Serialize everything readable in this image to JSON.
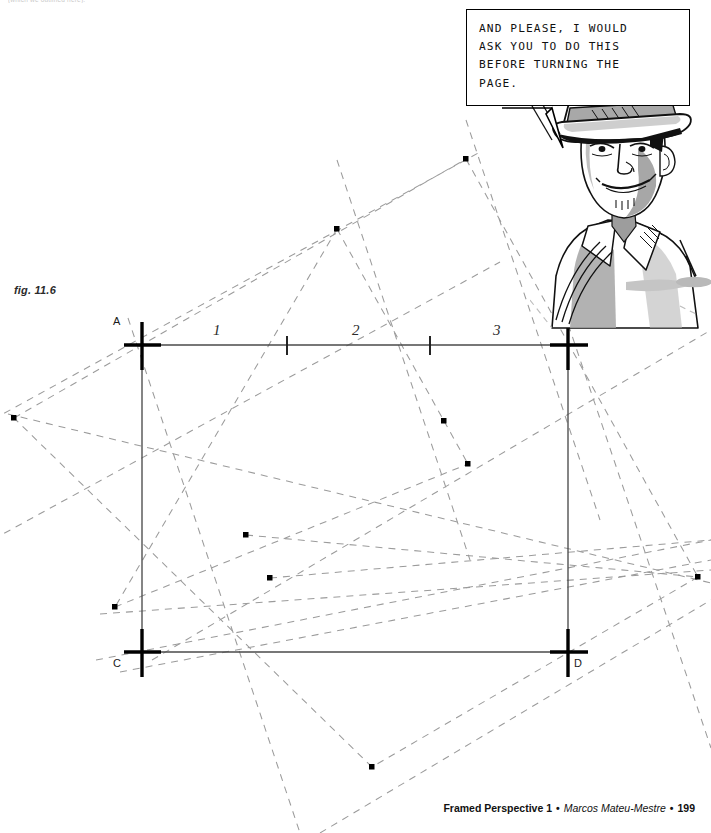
{
  "page": {
    "top_caption": "(which we outlined here).",
    "figure_label": "fig. 11.6",
    "width": 711,
    "height": 833,
    "background": "#ffffff"
  },
  "balloon": {
    "text": "AND PLEASE, I WOULD\nASK YOU TO DO THIS\nBEFORE TURNING THE\nPAGE.",
    "lines": [
      "AND PLEASE, I WOULD",
      "ASK YOU TO DO THIS",
      "BEFORE TURNING THE",
      "PAGE."
    ],
    "border_color": "#000000",
    "fill_color": "#ffffff"
  },
  "character": {
    "description": "man-in-fedora-hat-smirking",
    "ink_color": "#111111",
    "tone_color": "#9a9a9a",
    "light_tone_color": "#c8c8c8"
  },
  "diagram": {
    "solid_line_color": "#4a4a4a",
    "dashed_line_color": "#9b9b9b",
    "mark_color": "#000000",
    "vertices": [
      {
        "id": "A",
        "label": "A",
        "x": 142,
        "y": 345,
        "label_x": 113,
        "label_y": 315
      },
      {
        "id": "B",
        "label": "B",
        "x": 568,
        "y": 345,
        "label_x": 576,
        "label_y": 315
      },
      {
        "id": "C",
        "label": "C",
        "x": 142,
        "y": 652,
        "label_x": 113,
        "label_y": 657
      },
      {
        "id": "D",
        "label": "D",
        "x": 568,
        "y": 652,
        "label_x": 574,
        "label_y": 657
      }
    ],
    "segment_labels": [
      {
        "text": "1",
        "x": 213,
        "y": 322
      },
      {
        "text": "2",
        "x": 352,
        "y": 322
      },
      {
        "text": "3",
        "x": 493,
        "y": 322
      }
    ],
    "tick_marks_on_AB": [
      {
        "x": 287,
        "y": 345
      },
      {
        "x": 430,
        "y": 345
      }
    ],
    "intersection_dots": [
      {
        "x": 14,
        "y": 418
      },
      {
        "x": 337,
        "y": 229
      },
      {
        "x": 466,
        "y": 159
      },
      {
        "x": 115,
        "y": 607
      },
      {
        "x": 246,
        "y": 535
      },
      {
        "x": 270,
        "y": 578
      },
      {
        "x": 444,
        "y": 421
      },
      {
        "x": 468,
        "y": 464
      },
      {
        "x": 372,
        "y": 767
      },
      {
        "x": 698,
        "y": 577
      }
    ]
  },
  "footer": {
    "book_title": "Framed Perspective 1",
    "author": "Marcos Mateu-Mestre",
    "page_number": "199",
    "separator": "•"
  }
}
